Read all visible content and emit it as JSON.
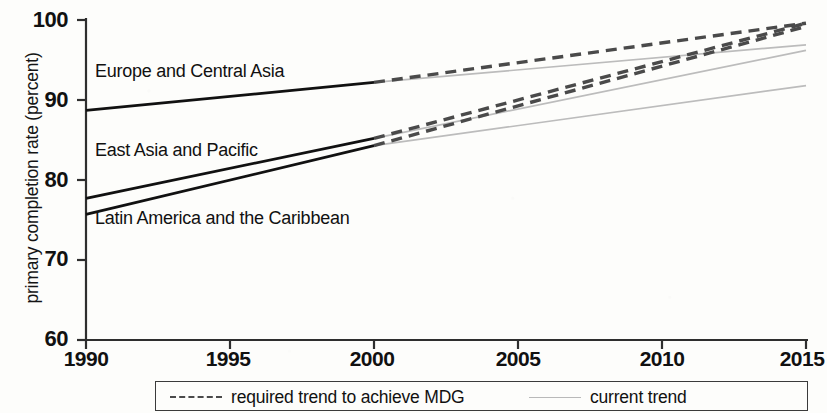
{
  "chart_data": {
    "type": "line",
    "title": "",
    "subtitle": "",
    "xlabel": "",
    "ylabel": "primary completion rate (percent)",
    "xlim": [
      1990,
      2015
    ],
    "ylim": [
      60,
      100
    ],
    "xticks": [
      1990,
      1995,
      2000,
      2005,
      2010,
      2015
    ],
    "yticks": [
      60,
      70,
      80,
      90,
      100
    ],
    "xtick_labels": [
      "1990",
      "1995",
      "2000",
      "2005",
      "2010",
      "2015"
    ],
    "ytick_labels": [
      "60",
      "70",
      "80",
      "90",
      "100"
    ],
    "grid": false,
    "legend_position": "bottom",
    "legend": [
      {
        "label": "required trend to achieve MDG",
        "style": "dashed",
        "color": "#4a4a4a"
      },
      {
        "label": "current trend",
        "style": "solid",
        "color": "#b9b9b9"
      }
    ],
    "series": [
      {
        "name": "Europe and Central Asia",
        "style": "solid-historical",
        "color": "#111111",
        "x": [
          1990,
          2000
        ],
        "values": [
          88.7,
          92.2
        ]
      },
      {
        "name": "East Asia and Pacific",
        "style": "solid-historical",
        "color": "#111111",
        "x": [
          1990,
          2000
        ],
        "values": [
          77.7,
          85.2
        ]
      },
      {
        "name": "Latin America and the Caribbean",
        "style": "solid-historical",
        "color": "#111111",
        "x": [
          1990,
          2000
        ],
        "values": [
          75.7,
          84.3
        ]
      },
      {
        "name": "Europe and Central Asia required trend to achieve MDG",
        "style": "dashed",
        "color": "#4a4a4a",
        "x": [
          2000,
          2015
        ],
        "values": [
          92.2,
          99.6
        ]
      },
      {
        "name": "East Asia and Pacific required trend to achieve MDG",
        "style": "dashed",
        "color": "#4a4a4a",
        "x": [
          2000,
          2015
        ],
        "values": [
          85.2,
          99.6
        ]
      },
      {
        "name": "Latin America and the Caribbean required trend to achieve MDG",
        "style": "dashed",
        "color": "#4a4a4a",
        "x": [
          2000,
          2015
        ],
        "values": [
          84.3,
          99.2
        ]
      },
      {
        "name": "Europe and Central Asia current trend",
        "style": "solid-projection",
        "color": "#bcbcbc",
        "x": [
          2000,
          2015
        ],
        "values": [
          92.2,
          96.9
        ]
      },
      {
        "name": "East Asia and Pacific current trend",
        "style": "solid-projection",
        "color": "#bcbcbc",
        "x": [
          2000,
          2015
        ],
        "values": [
          85.2,
          96.2
        ]
      },
      {
        "name": "Latin America and the Caribbean current trend",
        "style": "solid-projection",
        "color": "#bcbcbc",
        "x": [
          2000,
          2015
        ],
        "values": [
          84.3,
          91.8
        ]
      }
    ],
    "annotations": [
      {
        "text": "Europe and Central Asia",
        "x": 1990.2,
        "y": 93.0
      },
      {
        "text": "East Asia and Pacific",
        "x": 1990.2,
        "y": 82.2
      },
      {
        "text": "Latin America and the Caribbean",
        "x": 1990.2,
        "y": 74.2
      }
    ]
  },
  "axis": {
    "y_title": "primary completion rate (percent)",
    "y_ticks": [
      "100",
      "90",
      "80",
      "70",
      "60"
    ],
    "x_ticks": [
      "1990",
      "1995",
      "2000",
      "2005",
      "2010",
      "2015"
    ]
  },
  "series_labels": {
    "europe": "Europe and Central Asia",
    "east_asia": "East Asia and Pacific",
    "latin_america": "Latin America and the Caribbean"
  },
  "legend": {
    "required_label": "required trend to achieve MDG",
    "current_label": "current trend"
  },
  "colors": {
    "historical_line": "#111111",
    "required_trend": "#4a4a4a",
    "current_trend": "#bcbcbc",
    "axis": "#2e2e2e",
    "background": "#fdfdfb"
  }
}
